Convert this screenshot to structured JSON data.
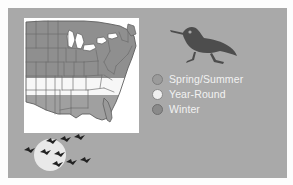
{
  "figure": {
    "kind": "bird-range-map",
    "panel_color": "#a9a9a9",
    "background_color": "#fdfdfd"
  },
  "map": {
    "name": "us-range-map",
    "background_color": "#ffffff",
    "state_outline_color": "#6b6b6b",
    "regions": [
      {
        "id": "spring-summer",
        "label": "Spring/Summer",
        "color": "#8f8f8f",
        "position": "northern-and-central-us"
      },
      {
        "id": "year-round",
        "label": "Year-Round",
        "color": "#f5f5f5",
        "position": "mid-south-band"
      },
      {
        "id": "winter",
        "label": "Winter",
        "color": "#a0a0a0",
        "position": "southern-us-and-gulf"
      }
    ]
  },
  "bird_mark": {
    "name": "shorebird-silhouette",
    "color": "#4a4a4a",
    "description": "shorebird standing, long bill, facing left"
  },
  "flock": {
    "name": "migrating-flock",
    "moon_color": "#e8e8e8",
    "bird_color": "#262626",
    "bird_count": 7
  },
  "legend": {
    "title": "",
    "items": [
      {
        "label": "Spring/Summer",
        "color": "#9b9b9b",
        "border": "#7e7e7e"
      },
      {
        "label": "Year-Round",
        "color": "#f0f0f0",
        "border": "#8a8a8a"
      },
      {
        "label": "Winter",
        "color": "#8a8a8a",
        "border": "#6f6f6f"
      }
    ],
    "text_color": "#f2f2f2"
  }
}
